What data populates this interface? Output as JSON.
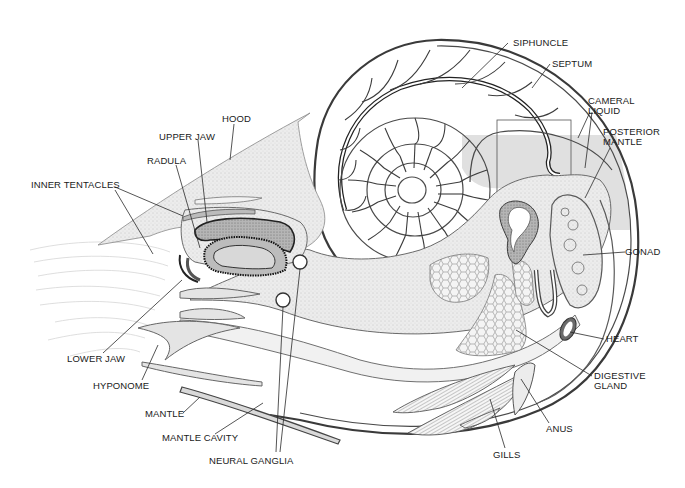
{
  "figure": {
    "shading_color": "#e0e0e0",
    "line_color": "#2a2a2a",
    "background": "#ffffff"
  },
  "labels": {
    "siphuncle": "SIPHUNCLE",
    "septum": "SEPTUM",
    "cameral_liquid_1": "CAMERAL",
    "cameral_liquid_2": "LIQUID",
    "posterior_mantle_1": "POSTERIOR",
    "posterior_mantle_2": "MANTLE",
    "hood": "HOOD",
    "upper_jaw": "UPPER JAW",
    "radula": "RADULA",
    "inner_tentacles": "INNER TENTACLES",
    "gonad": "GONAD",
    "heart": "HEART",
    "digestive_gland_1": "DIGESTIVE",
    "digestive_gland_2": "GLAND",
    "anus": "ANUS",
    "gills": "GILLS",
    "lower_jaw": "LOWER JAW",
    "hyponome": "HYPONOME",
    "mantle": "MANTLE",
    "mantle_cavity": "MANTLE CAVITY",
    "neural_ganglia": "NEURAL GANGLIA"
  }
}
